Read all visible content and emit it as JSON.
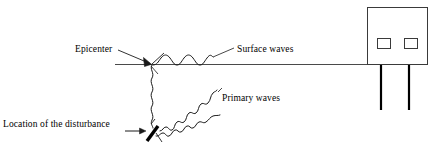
{
  "diagram": {
    "background_color": "#ffffff",
    "stroke_color": "#1a1a1a",
    "labels": {
      "epicenter": "Epicenter",
      "surface_waves": "Surface waves",
      "primary_waves": "Primary waves",
      "location_of_disturbance": "Location of the disturbance"
    },
    "elements": {
      "ground_line": "ground-line",
      "epicenter_arrow": "epicenter-arrow",
      "disturbance_arrow": "disturbance-arrow",
      "disturbance_mark": "fault-slash",
      "surface_wave_path": "surface-wave",
      "vertical_wave_path": "vertical-wave",
      "primary_wave_upper": "primary-wave-upper",
      "primary_wave_lower": "primary-wave-lower",
      "building": "building-box",
      "window_left": "building-window-left",
      "window_right": "building-window-right",
      "column_left": "building-column-left",
      "column_right": "building-column-right",
      "surface_leader": "surface-waves-leader-line",
      "primary_leader": "primary-waves-leader-line"
    }
  }
}
